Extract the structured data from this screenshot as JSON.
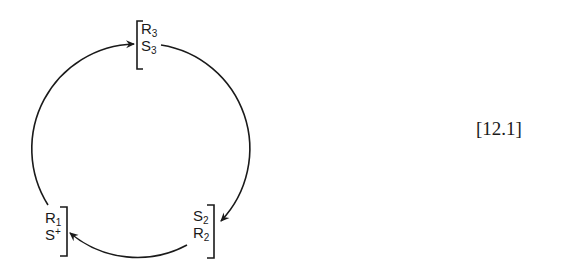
{
  "diagram": {
    "type": "cyclic reaction scheme",
    "colors": {
      "stroke": "#1a1a1a",
      "background": "#ffffff"
    },
    "nodes": [
      {
        "id": "top",
        "bracket_side": "left",
        "rows": [
          {
            "base": "R",
            "sub": "3",
            "sup": ""
          },
          {
            "base": "S",
            "sub": "3",
            "sup": ""
          }
        ]
      },
      {
        "id": "bottom-right",
        "bracket_side": "right",
        "rows": [
          {
            "base": "S",
            "sub": "2",
            "sup": ""
          },
          {
            "base": "R",
            "sub": "2",
            "sup": ""
          }
        ]
      },
      {
        "id": "bottom-left",
        "bracket_side": "right",
        "rows": [
          {
            "base": "R",
            "sub": "1",
            "sup": ""
          },
          {
            "base": "S",
            "sub": "",
            "sup": "+"
          }
        ]
      }
    ],
    "edges": [
      {
        "from": "bottom-left",
        "to": "top",
        "direction": "clockwise",
        "arrow_at": "top"
      },
      {
        "from": "top",
        "to": "bottom-right",
        "direction": "clockwise",
        "arrow_at": "bottom-right"
      },
      {
        "from": "bottom-right",
        "to": "bottom-left",
        "direction": "clockwise",
        "arrow_at": "bottom-left"
      }
    ],
    "equation_label": "[12.1]"
  }
}
